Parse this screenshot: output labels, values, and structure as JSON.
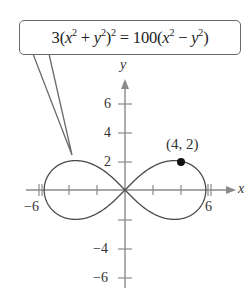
{
  "equation": {
    "coef_left": "3",
    "coef_right": "100",
    "text": "3(x^2 + y^2)^2 = 100(x^2 - y^2)"
  },
  "axes": {
    "x_label": "x",
    "y_label": "y",
    "x_ticks": [
      -6,
      -4,
      -2,
      2,
      4,
      6
    ],
    "y_ticks": [
      -6,
      -4,
      -2,
      2,
      4,
      6
    ],
    "x_tick_labels": [
      "-6",
      "6"
    ],
    "y_tick_labels": [
      "6",
      "4",
      "2",
      "-4",
      "-6"
    ]
  },
  "point": {
    "label": "(4, 2)",
    "x": 4,
    "y": 2
  },
  "colors": {
    "curve": "#4a4a4a",
    "axis": "#8a8a8a",
    "point": "#111111",
    "box_border": "#6a6a6a"
  },
  "labels": {
    "neg6x": "−6",
    "pos6x": "6",
    "y6": "6",
    "y4": "4",
    "y2": "2",
    "yneg4": "−4",
    "yneg6": "−6"
  }
}
